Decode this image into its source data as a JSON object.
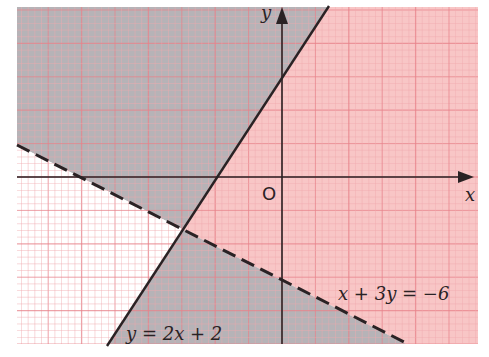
{
  "diagram": {
    "type": "inequality-regions",
    "axes": {
      "x_label": "x",
      "y_label": "y",
      "origin_label": "O"
    },
    "lines": [
      {
        "id": "line1",
        "equation": "y = 2x + 2",
        "style": "solid",
        "label": "y = 2x + 2"
      },
      {
        "id": "line2",
        "equation": "x + 3y = −6",
        "style": "dashed",
        "label": "x + 3y = −6"
      }
    ],
    "regions": [
      {
        "id": "top-left",
        "description": "left of y = 2x + 2, above x + 3y = −6",
        "shade": "gray"
      },
      {
        "id": "right",
        "description": "right of y = 2x + 2, above x + 3y = −6",
        "shade": "pink"
      },
      {
        "id": "bottom",
        "description": "right of y = 2x + 2, below x + 3y = −6",
        "shade": "gray"
      },
      {
        "id": "bottom-left",
        "description": "left of y = 2x + 2, below x + 3y = −6",
        "shade": "unshaded"
      }
    ],
    "colors": {
      "gray_region": "#b6b3b7",
      "pink_region": "#f8c6c6",
      "unshaded": "#ffffff",
      "grid_minor": "#f2a9ae",
      "grid_major": "#e8838b",
      "ink": "#2a2224"
    }
  }
}
